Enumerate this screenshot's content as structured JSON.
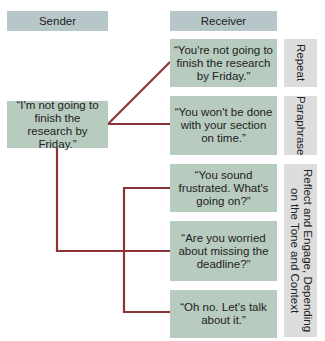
{
  "headers": {
    "sender": "Sender",
    "receiver": "Receiver"
  },
  "sender_statement": "“I'm not going to finish the research by Friday.”",
  "responses": [
    "“You're not going to finish the research by Friday.”",
    "“You won't be done with your section on time.”",
    "“You sound frustrated. What's going on?”",
    "“Are you worried about missing the deadline?”",
    "“Oh no. Let's talk about it.”"
  ],
  "categories": [
    "Repeat",
    "Paraphrase",
    "Reflect and Engage, Depending\non the Tone and Context"
  ],
  "colors": {
    "header": "#b7c6c8",
    "content": "#b8cbbf",
    "label": "#dcdddc",
    "connector": "#8b3336"
  }
}
